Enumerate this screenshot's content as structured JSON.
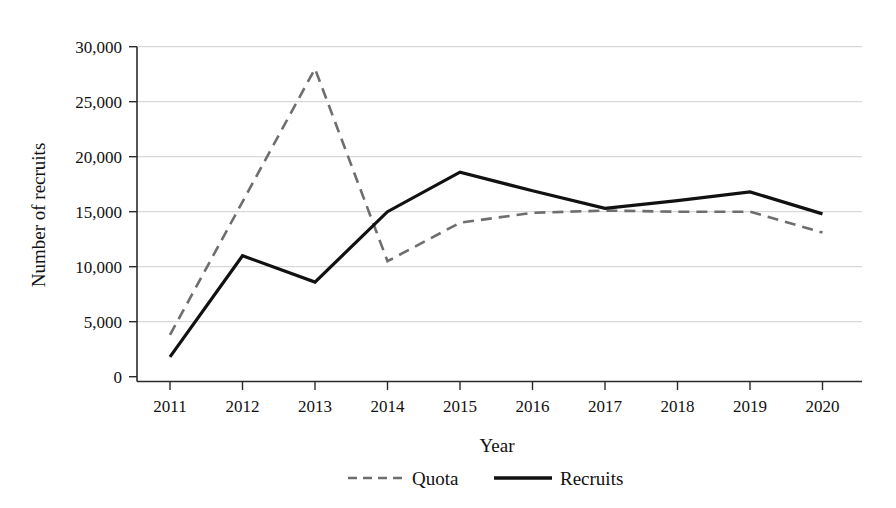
{
  "chart_data": {
    "type": "line",
    "title": "",
    "xlabel": "Year",
    "ylabel": "Number of recruits",
    "categories": [
      "2011",
      "2012",
      "2013",
      "2014",
      "2015",
      "2016",
      "2017",
      "2018",
      "2019",
      "2020"
    ],
    "x": [
      2011,
      2012,
      2013,
      2014,
      2015,
      2016,
      2017,
      2018,
      2019,
      2020
    ],
    "series": [
      {
        "name": "Quota",
        "style": "dashed",
        "color": "#6e6e6e",
        "values": [
          3800,
          15900,
          28000,
          10500,
          14000,
          14900,
          15100,
          15000,
          15000,
          13100
        ]
      },
      {
        "name": "Recruits",
        "style": "solid",
        "color": "#111111",
        "values": [
          1800,
          11000,
          8600,
          15000,
          18600,
          16900,
          15300,
          16000,
          16800,
          14800
        ]
      }
    ],
    "ylim": [
      0,
      30000
    ],
    "yticks": [
      0,
      5000,
      10000,
      15000,
      20000,
      25000,
      30000
    ],
    "ytick_labels": [
      "0",
      "5,000",
      "10,000",
      "15,000",
      "20,000",
      "25,000",
      "30,000"
    ],
    "xtick_labels": [
      "2011",
      "2012",
      "2013",
      "2014",
      "2015",
      "2016",
      "2017",
      "2018",
      "2019",
      "2020"
    ],
    "grid": true,
    "grid_axis": "y",
    "legend_position": "bottom-center",
    "legend_entries": [
      "Quota",
      "Recruits"
    ]
  },
  "axes": {
    "y_title": "Number of recruits",
    "x_title": "Year"
  },
  "legend": {
    "quota_label": "Quota",
    "recruits_label": "Recruits"
  },
  "yticks": {
    "t0": "0",
    "t1": "5,000",
    "t2": "10,000",
    "t3": "15,000",
    "t4": "20,000",
    "t5": "25,000",
    "t6": "30,000"
  },
  "xticks": {
    "x0": "2011",
    "x1": "2012",
    "x2": "2013",
    "x3": "2014",
    "x4": "2015",
    "x5": "2016",
    "x6": "2017",
    "x7": "2018",
    "x8": "2019",
    "x9": "2020"
  },
  "colors": {
    "quota": "#6e6e6e",
    "recruits": "#111111",
    "grid": "#c9c9c9",
    "axis": "#2b2b2b",
    "background": "#ffffff"
  }
}
